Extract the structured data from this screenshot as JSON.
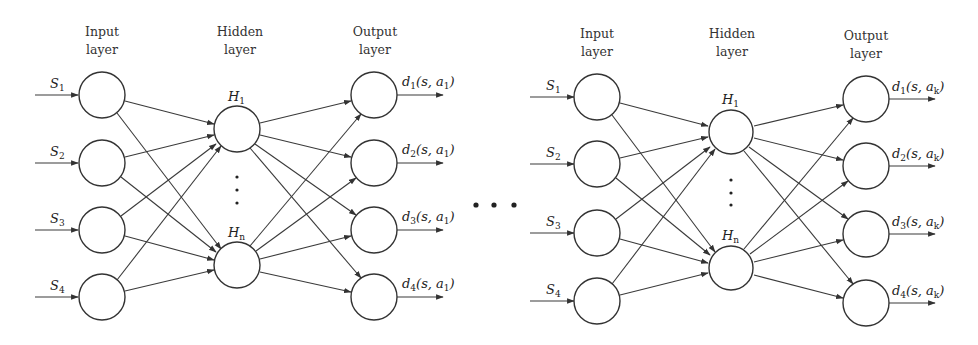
{
  "diagram": {
    "between_networks_ellipsis": "• • •",
    "networks": [
      {
        "id": "network-a1",
        "action_label": "a",
        "action_sub": "1",
        "layer_titles": {
          "input": [
            "Input",
            "layer"
          ],
          "hidden": [
            "Hidden",
            "layer"
          ],
          "output": [
            "Output",
            "layer"
          ]
        },
        "inputs": [
          {
            "label": "S",
            "sub": "1"
          },
          {
            "label": "S",
            "sub": "2"
          },
          {
            "label": "S",
            "sub": "3"
          },
          {
            "label": "S",
            "sub": "4"
          }
        ],
        "hidden": [
          {
            "label": "H",
            "sub": "1"
          },
          {
            "label": "H",
            "sub": "n"
          }
        ],
        "hidden_ellipsis": "⋮",
        "outputs": [
          {
            "label": "d",
            "sub": "1",
            "args": "(s, a",
            "arg_sub": "1",
            "close": ")"
          },
          {
            "label": "d",
            "sub": "2",
            "args": "(s, a",
            "arg_sub": "1",
            "close": ")"
          },
          {
            "label": "d",
            "sub": "3",
            "args": "(s, a",
            "arg_sub": "1",
            "close": ")"
          },
          {
            "label": "d",
            "sub": "4",
            "args": "(s, a",
            "arg_sub": "1",
            "close": ")"
          }
        ]
      },
      {
        "id": "network-ak",
        "action_label": "a",
        "action_sub": "k",
        "layer_titles": {
          "input": [
            "Input",
            "layer"
          ],
          "hidden": [
            "Hidden",
            "layer"
          ],
          "output": [
            "Output",
            "layer"
          ]
        },
        "inputs": [
          {
            "label": "S",
            "sub": "1"
          },
          {
            "label": "S",
            "sub": "2"
          },
          {
            "label": "S",
            "sub": "3"
          },
          {
            "label": "S",
            "sub": "4"
          }
        ],
        "hidden": [
          {
            "label": "H",
            "sub": "1"
          },
          {
            "label": "H",
            "sub": "n"
          }
        ],
        "hidden_ellipsis": "⋮",
        "outputs": [
          {
            "label": "d",
            "sub": "1",
            "args": "(s, a",
            "arg_sub": "k",
            "close": ")"
          },
          {
            "label": "d",
            "sub": "2",
            "args": "(s, a",
            "arg_sub": "k",
            "close": ")"
          },
          {
            "label": "d",
            "sub": "3",
            "args": "(s, a",
            "arg_sub": "k",
            "close": ")"
          },
          {
            "label": "d",
            "sub": "4",
            "args": "(s, a",
            "arg_sub": "k",
            "close": ")"
          }
        ]
      }
    ]
  }
}
